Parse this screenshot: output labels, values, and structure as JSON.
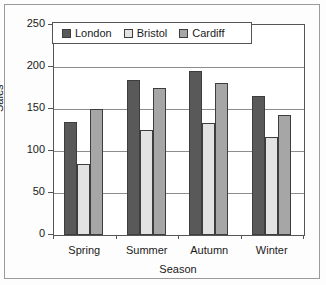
{
  "chart_data": {
    "type": "bar",
    "title": "",
    "xlabel": "Season",
    "ylabel": "Sales",
    "categories": [
      "Spring",
      "Summer",
      "Autumn",
      "Winter"
    ],
    "series": [
      {
        "name": "London",
        "color": "#595959",
        "values": [
          135,
          185,
          195,
          165
        ]
      },
      {
        "name": "Bristol",
        "color": "#e2e2e2",
        "values": [
          84,
          125,
          133,
          117
        ]
      },
      {
        "name": "Cardiff",
        "color": "#a6a6a6",
        "values": [
          150,
          175,
          181,
          143
        ]
      }
    ],
    "ylim": [
      0,
      250
    ],
    "yticks": [
      0,
      50,
      100,
      150,
      200,
      250
    ],
    "ytick_labels": [
      "0",
      "50",
      "100",
      "150",
      "200",
      "250"
    ],
    "grid": true,
    "grid_axis": "y",
    "legend_position": "upper-left-inside",
    "bar_edge_color": "#3d3d3d",
    "axis_color": "#555555",
    "plot_background": "#ffffff",
    "figure_background": "#fdfdfd"
  },
  "legend": {
    "entries": [
      {
        "label": "London"
      },
      {
        "label": "Bristol"
      },
      {
        "label": "Cardiff"
      }
    ]
  },
  "axes": {
    "y_title": "Sales",
    "x_title": "Season",
    "y_labels": [
      "250",
      "200",
      "150",
      "100",
      "50",
      "0"
    ],
    "x_labels": [
      "Spring",
      "Summer",
      "Autumn",
      "Winter"
    ]
  }
}
